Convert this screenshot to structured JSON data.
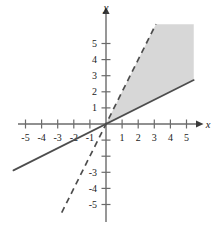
{
  "chart_data": {
    "type": "line",
    "title": "",
    "subtitle": "",
    "xlabel": "x",
    "ylabel": "y",
    "xlim": [
      -6.6,
      7.0
    ],
    "ylim": [
      -6.6,
      6.6
    ],
    "grid": false,
    "legend": null,
    "annotations": [],
    "axis_origin_px": {
      "x": 106,
      "y": 124
    },
    "unit_px": {
      "x": 16.1,
      "y": 16.1
    },
    "x_ticks": [
      -5,
      -4,
      -3,
      -2,
      -1,
      1,
      2,
      3,
      4,
      5
    ],
    "x_tick_labels": [
      "-5",
      "-4",
      "-3",
      "-2",
      "-1",
      "1",
      "2",
      "3",
      "4",
      "5"
    ],
    "y_ticks": [
      5,
      4,
      3,
      2,
      1,
      -1,
      -2,
      -3,
      -4,
      -5
    ],
    "y_tick_labels": [
      "5",
      "4",
      "3",
      "2",
      "1",
      "",
      "",
      "-3",
      "-4",
      "-5"
    ],
    "series": [
      {
        "name": "boundary-solid",
        "style": "solid",
        "color": "#4d4d4d",
        "slope": 0.5,
        "intercept": 0,
        "equation": "y = x/2",
        "x": [
          -5.75,
          5.45
        ],
        "values": [
          -2.88,
          2.73
        ]
      },
      {
        "name": "boundary-dashed",
        "style": "dashed",
        "color": "#4d4d4d",
        "slope": 2.0,
        "intercept": 0,
        "equation": "y = 2x",
        "x": [
          -2.75,
          3.1
        ],
        "values": [
          -5.5,
          6.2
        ]
      }
    ],
    "shaded_region": {
      "name": "solution-region",
      "fill": "#d7d7d7",
      "description": "region between y = x/2 and y = 2x in the first quadrant",
      "vertices_data": [
        [
          0,
          0
        ],
        [
          3.1,
          6.2
        ],
        [
          5.45,
          6.2
        ],
        [
          5.45,
          2.73
        ]
      ]
    },
    "colors": {
      "axis": "#6b6b6b",
      "curve": "#4d4d4d",
      "shade": "#d7d7d7",
      "text": "#1a1a1a",
      "background": "#ffffff"
    }
  }
}
